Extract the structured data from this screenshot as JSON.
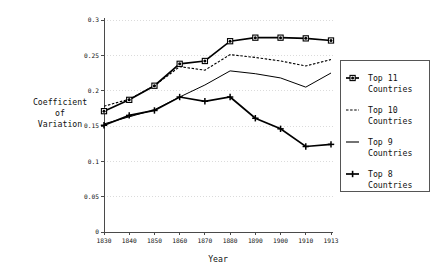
{
  "chart_data": {
    "type": "line",
    "title": "",
    "xlabel": "Year",
    "ylabel": "Coefficient of Variation",
    "ylabel_lines": [
      "Coefficient",
      "of",
      "Variation"
    ],
    "categories": [
      "1830",
      "1840",
      "1850",
      "1860",
      "1870",
      "1880",
      "1890",
      "1900",
      "1910",
      "1913"
    ],
    "x": [
      1830,
      1840,
      1850,
      1860,
      1870,
      1880,
      1890,
      1900,
      1910,
      1913
    ],
    "xlim": [
      1830,
      1913
    ],
    "ylim": [
      0,
      0.3
    ],
    "yticks": [
      "0",
      "0.05",
      "0.1",
      "0.15",
      "0.2",
      "0.25",
      "0.3"
    ],
    "ytick_values": [
      0,
      0.05,
      0.1,
      0.15,
      0.2,
      0.25,
      0.3
    ],
    "grid": true,
    "legend_position": "right",
    "series": [
      {
        "name": "Top 11 Countries",
        "marker": "square-dot",
        "style": "solid-thick",
        "values": [
          0.171,
          0.187,
          0.207,
          0.238,
          0.242,
          0.27,
          0.275,
          0.275,
          0.274,
          0.271
        ]
      },
      {
        "name": "Top 10 Countries",
        "marker": "none",
        "style": "dotted",
        "values": [
          0.178,
          0.188,
          0.207,
          0.234,
          0.229,
          0.251,
          0.247,
          0.242,
          0.235,
          0.244
        ]
      },
      {
        "name": "Top 9 Countries",
        "marker": "none",
        "style": "solid-thin",
        "values": [
          0.153,
          0.163,
          0.173,
          0.191,
          0.208,
          0.228,
          0.224,
          0.218,
          0.205,
          0.225
        ]
      },
      {
        "name": "Top 8 Countries",
        "marker": "plus",
        "style": "solid-thick",
        "values": [
          0.151,
          0.165,
          0.172,
          0.191,
          0.185,
          0.191,
          0.161,
          0.146,
          0.121,
          0.124
        ]
      }
    ]
  },
  "legend": {
    "entries": [
      {
        "line1": "Top 11",
        "line2": "Countries"
      },
      {
        "line1": "Top 10",
        "line2": "Countries"
      },
      {
        "line1": "Top 9",
        "line2": "Countries"
      },
      {
        "line1": "Top 8",
        "line2": "Countries"
      }
    ]
  },
  "colors": {
    "series": "#000000",
    "axis": "#4a4a4a",
    "grid": "#cccccc",
    "background": "#ffffff",
    "text": "#111111"
  }
}
